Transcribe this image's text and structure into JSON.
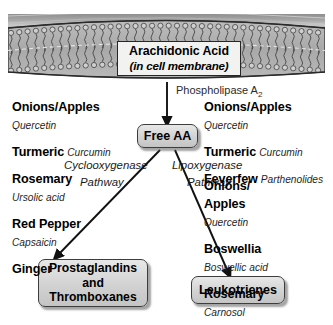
{
  "membrane": {
    "title": "Arachidonic Acid",
    "subtitle": "(in cell membrane)"
  },
  "enzyme": {
    "name": "Phospholipase A",
    "subscript": "2"
  },
  "nodes": {
    "free_aa": "Free AA",
    "prostaglandins_line1": "Prostaglandins",
    "prostaglandins_line2": "and",
    "prostaglandins_line3": "Thromboxanes",
    "leukotrienes": "Leukotrienes"
  },
  "pathways": {
    "cox_line1": "Cyclooxygenase",
    "cox_line2": "Pathway",
    "lox_line1": "Lipoxygenase",
    "lox_line2": "Pathway"
  },
  "left_column": [
    {
      "herb": "Onions/Apples",
      "compound": "Quercetin",
      "inline": false
    },
    {
      "herb": "Turmeric",
      "compound": "Curcumin",
      "inline": true
    },
    {
      "herb": "Rosemary",
      "compound": "Ursolic acid",
      "inline": false
    },
    {
      "herb": "Red Pepper",
      "compound": "Capsaicin",
      "inline": false
    },
    {
      "herb": "Ginger",
      "compound": "",
      "inline": false
    }
  ],
  "right_column_top": [
    {
      "herb": "Onions/Apples",
      "compound": "Quercetin",
      "inline": false
    },
    {
      "herb": "Turmeric",
      "compound": "Curcumin",
      "inline": true
    },
    {
      "herb": "Feverfew",
      "compound": "Parthenolides",
      "inline": true
    }
  ],
  "right_column_bottom": [
    {
      "herb": "Onions/\nApples",
      "compound": "Quercetin",
      "inline": false
    },
    {
      "herb": "Boswellia",
      "compound": "Boswellic acid",
      "inline": false
    },
    {
      "herb": "Rosemary",
      "compound": "Carnosol",
      "inline": false
    }
  ],
  "colors": {
    "membrane_fill": "#b4b4b4",
    "membrane_band": "#9a9a9a",
    "node_fill": "#d8d8d8",
    "stroke": "#262626"
  }
}
